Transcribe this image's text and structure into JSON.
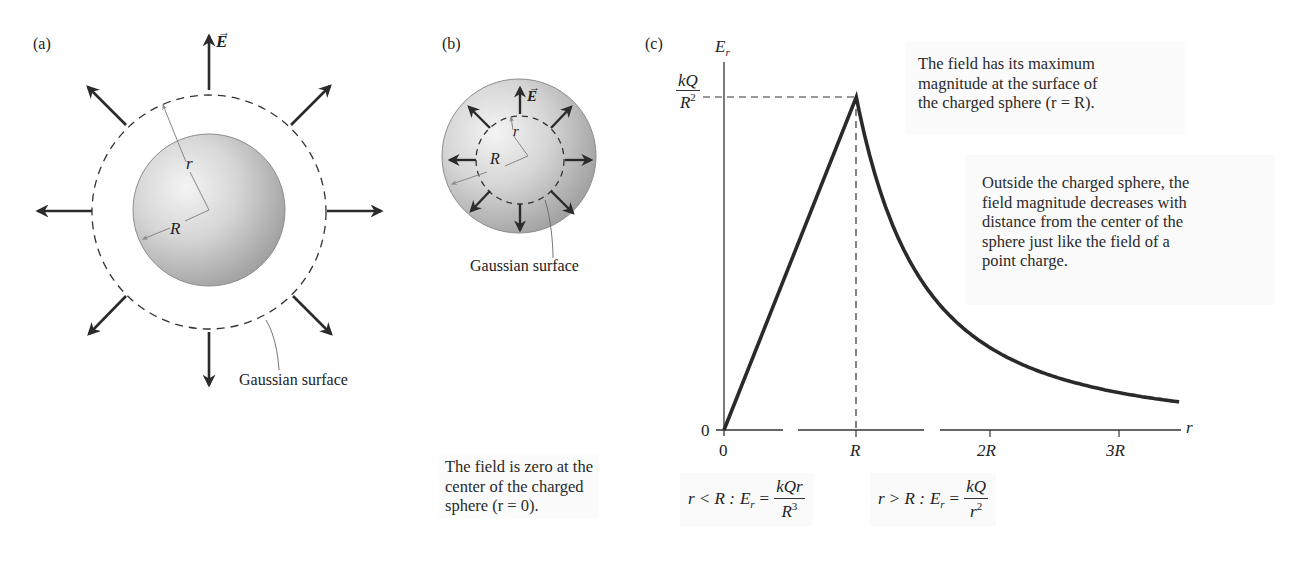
{
  "panels": {
    "a": {
      "label": "(a)",
      "field_label": "E",
      "radius_inner_label": "R",
      "radius_outer_label": "r",
      "surface_label": "Gaussian surface"
    },
    "b": {
      "label": "(b)",
      "field_label": "E",
      "radius_inner_label": "r",
      "radius_outer_label": "R",
      "surface_label": "Gaussian surface"
    },
    "c": {
      "label": "(c)",
      "y_axis_label": "E",
      "y_axis_sub": "r",
      "x_axis_label": "r",
      "y_max_label_num": "kQ",
      "y_max_label_den": "R",
      "y_max_label_den_sup": "2",
      "y_zero_label": "0",
      "x_ticks": [
        "0",
        "R",
        "2R",
        "3R"
      ],
      "notes": {
        "max": [
          "The field has its maximum",
          "magnitude at the surface of",
          "the charged sphere (r = R)."
        ],
        "outside": [
          "Outside the charged sphere, the",
          "field magnitude decreases with",
          "distance from the center of the",
          "sphere just like the field of a",
          "point charge."
        ],
        "zero": [
          "The field is zero at the",
          "center of the charged",
          "sphere (r = 0)."
        ]
      },
      "equations": {
        "inside": {
          "cond": "r < R :",
          "lhs": "E",
          "lhs_sub": "r",
          "eq": "=",
          "num": "kQr",
          "den": "R",
          "den_sup": "3"
        },
        "outside": {
          "cond": "r > R :",
          "lhs": "E",
          "lhs_sub": "r",
          "eq": "=",
          "num": "kQ",
          "den": "r",
          "den_sup": "2"
        }
      }
    }
  },
  "chart_data": {
    "type": "line",
    "xlabel": "r",
    "ylabel": "E_r",
    "x_tick_labels": [
      "0",
      "R",
      "2R",
      "3R"
    ],
    "y_tick_labels": [
      "0",
      "kQ/R^2"
    ],
    "x_units": "multiples of R",
    "y_units": "multiples of kQ/R^2",
    "xlim": [
      0,
      3.45
    ],
    "ylim": [
      0,
      1
    ],
    "series": [
      {
        "name": "inside (r < R): E_r = kQr/R^3",
        "x": [
          0,
          0.25,
          0.5,
          0.75,
          1.0
        ],
        "y": [
          0,
          0.25,
          0.5,
          0.75,
          1.0
        ]
      },
      {
        "name": "outside (r > R): E_r = kQ/r^2",
        "x": [
          1.0,
          1.25,
          1.5,
          2.0,
          2.5,
          3.0,
          3.45
        ],
        "y": [
          1.0,
          0.64,
          0.444,
          0.25,
          0.16,
          0.111,
          0.084
        ]
      }
    ],
    "annotations": [
      "The field has its maximum magnitude at the surface of the charged sphere (r = R).",
      "Outside the charged sphere, the field magnitude decreases with distance from the center of the sphere just like the field of a point charge.",
      "The field is zero at the center of the charged sphere (r = 0)."
    ],
    "grid": false,
    "legend": "none"
  }
}
